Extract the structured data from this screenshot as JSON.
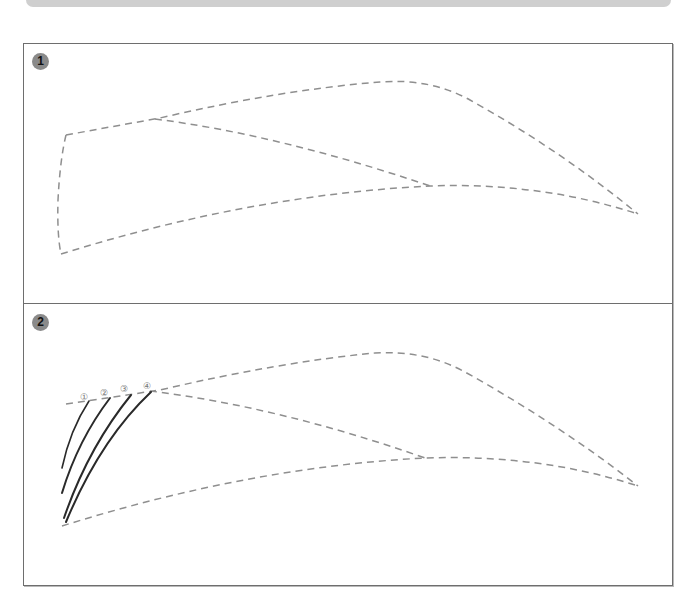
{
  "header": {
    "bar": "decorative-top-bar"
  },
  "panels": [
    {
      "step": "1",
      "description": "Dashed outline of eyebrow shape"
    },
    {
      "step": "2",
      "description": "Dashed outline with first hair strokes drawn"
    }
  ],
  "strokes": {
    "labels": [
      "①",
      "②",
      "③",
      "④"
    ]
  },
  "colors": {
    "dash": "#8f8f8f",
    "stroke": "#2a2a2a",
    "badge": "#8a8a8a",
    "border": "#6e6e6e"
  }
}
